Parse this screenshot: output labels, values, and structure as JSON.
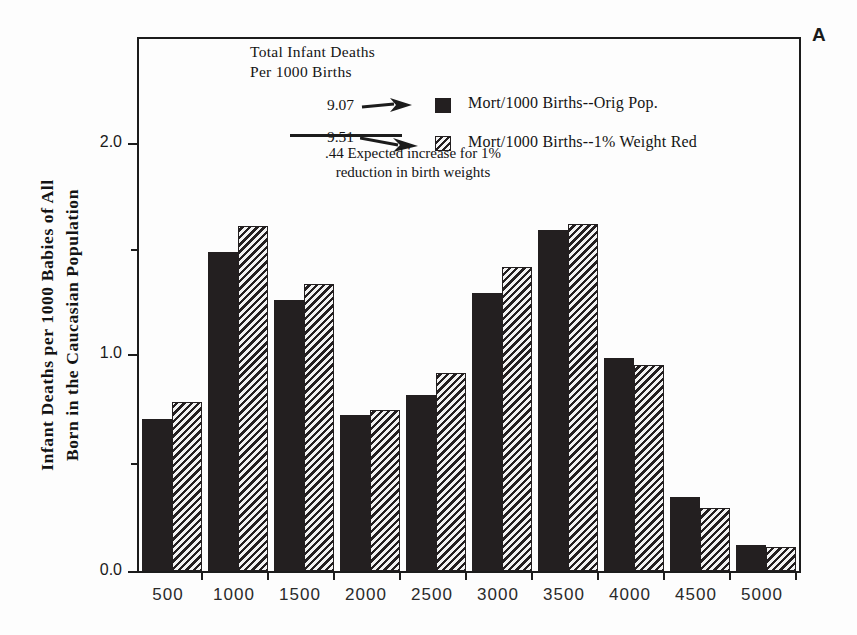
{
  "panel": {
    "letter": "A"
  },
  "axes": {
    "ylabel": "Infant Deaths per 1000 Babies of All\nBorn in the Caucasian Population",
    "yticks": [
      "0.0",
      "1.0",
      "2.0"
    ],
    "xticks": [
      "500",
      "1000",
      "1500",
      "2000",
      "2500",
      "3000",
      "3500",
      "4000",
      "4500",
      "5000"
    ]
  },
  "legend": {
    "title": "Total Infant Deaths\nPer 1000 Births",
    "rows": [
      {
        "value": "9.07",
        "label": "Mort/1000 Births--Orig Pop.",
        "swatch": "solid-square-icon"
      },
      {
        "value": "9.51",
        "label": "Mort/1000 Births--1% Weight Red",
        "swatch": "hatched-square-icon"
      }
    ],
    "note": ".44 Expected increase for 1%\nreduction in birth weights"
  },
  "colors": {
    "ink": "#231f20",
    "axis": "#1c1c1c",
    "background": "#fdfdfd"
  },
  "chart_data": {
    "type": "bar",
    "title": "",
    "subtitle": "",
    "xlabel": "",
    "ylabel": "Infant Deaths per 1000 Babies of All Born in the Caucasian Population",
    "categories": [
      "500",
      "1000",
      "1500",
      "2000",
      "2500",
      "3000",
      "3500",
      "4000",
      "4500",
      "5000"
    ],
    "series": [
      {
        "name": "Mort/1000 Births--Orig Pop.",
        "fill": "solid",
        "total": 9.07,
        "values": [
          0.7,
          1.47,
          1.25,
          0.72,
          0.81,
          1.28,
          1.57,
          0.98,
          0.34,
          0.12
        ]
      },
      {
        "name": "Mort/1000 Births--1% Weight Red",
        "fill": "hatched",
        "total": 9.51,
        "values": [
          0.78,
          1.59,
          1.32,
          0.74,
          0.91,
          1.4,
          1.6,
          0.95,
          0.29,
          0.11
        ]
      }
    ],
    "ylim": [
      0.0,
      2.45
    ],
    "ytick_values": [
      0.0,
      1.0,
      2.0
    ],
    "yminor_tick_values": [
      0.5,
      1.5
    ],
    "grid": false,
    "legend_position": "inside-top-center",
    "annotations": [
      {
        "text": ".44 Expected increase for 1% reduction in birth weights"
      },
      {
        "text": "Total Infant Deaths Per 1000 Births"
      }
    ]
  }
}
